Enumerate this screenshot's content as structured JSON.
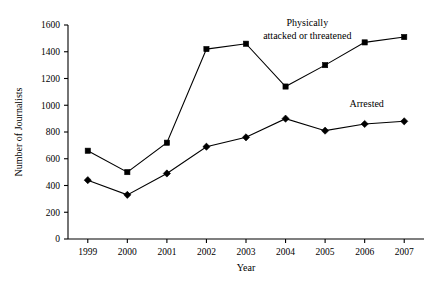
{
  "chart_data": {
    "type": "line",
    "title": "",
    "xlabel": "Year",
    "ylabel": "Number of Journalists",
    "categories": [
      "1999",
      "2000",
      "2001",
      "2002",
      "2003",
      "2004",
      "2005",
      "2006",
      "2007"
    ],
    "x": [
      1999,
      2000,
      2001,
      2002,
      2003,
      2004,
      2005,
      2006,
      2007
    ],
    "xlim": [
      1998.5,
      2007.5
    ],
    "ylim": [
      0,
      1600
    ],
    "yticks": [
      0,
      200,
      400,
      600,
      800,
      1000,
      1200,
      1400,
      1600
    ],
    "ytick_labels": [
      "0",
      "200",
      "400",
      "600",
      "800",
      "1000",
      "1200",
      "1400",
      "1600"
    ],
    "grid": false,
    "legend_position": "inline-annotations",
    "series": [
      {
        "name": "Physically attacked or threatened",
        "marker": "square",
        "color": "#000000",
        "values": [
          660,
          500,
          720,
          1420,
          1460,
          1140,
          1300,
          1470,
          1510
        ]
      },
      {
        "name": "Arrested",
        "marker": "diamond",
        "color": "#000000",
        "values": [
          440,
          330,
          490,
          690,
          760,
          900,
          810,
          860,
          880
        ]
      }
    ],
    "annotations": [
      {
        "id": "attacked-annotation",
        "lines": [
          "Physically",
          "attacked or threatened"
        ],
        "x": 2004.55,
        "y": 1595
      },
      {
        "id": "arrested-annotation",
        "lines": [
          "Arrested"
        ],
        "x": 2006.05,
        "y": 985
      }
    ]
  }
}
